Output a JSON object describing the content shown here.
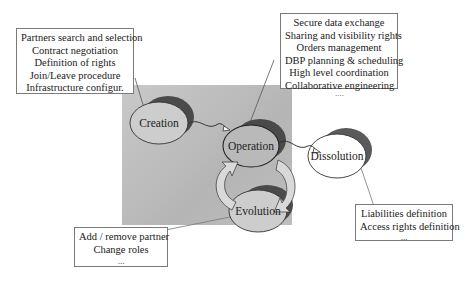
{
  "diagram": {
    "nodes": {
      "creation": {
        "label": "Creation"
      },
      "operation": {
        "label": "Operation"
      },
      "evolution": {
        "label": "Evolution"
      },
      "dissolution": {
        "label": "Dissolution"
      }
    },
    "boxes": {
      "creation": {
        "lines": [
          "Partners search and selection",
          "Contract negotiation",
          "Definition of rights",
          "Join/Leave procedure",
          "Infrastructure configur."
        ]
      },
      "operation": {
        "lines": [
          "Secure data exchange",
          "Sharing and visibility rights",
          "Orders management",
          "DBP planning & scheduling",
          "High level coordination",
          "Collaborative engineering"
        ],
        "more": "...."
      },
      "evolution": {
        "lines": [
          "Add / remove partner",
          "Change roles"
        ],
        "more": "..."
      },
      "dissolution": {
        "lines": [
          "Liabilities definition",
          "Access rights definition"
        ],
        "more": "..."
      }
    },
    "colors": {
      "background_region": "#bdbdbd",
      "node_fill": "#c8c8c8",
      "node_shadow": "#5a5a5a",
      "dissolution_fill": "#ffffff",
      "arrow_fill": "#d9d9d9",
      "border": "#7a7a7a"
    }
  }
}
